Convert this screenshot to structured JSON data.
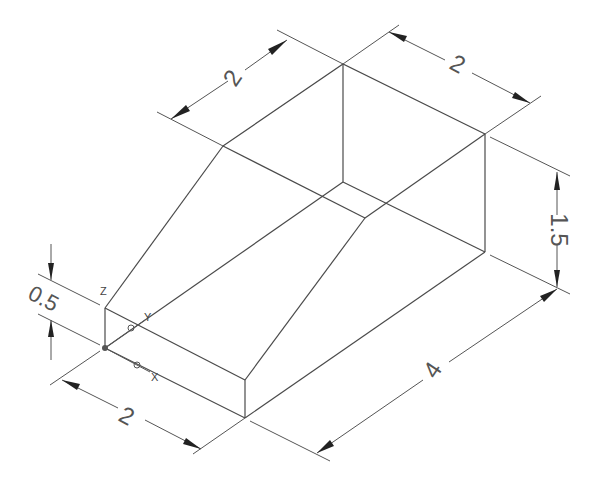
{
  "drawing": {
    "type": "isometric wedge / ramp block",
    "line_color": "#4a4a4a",
    "background": "#ffffff"
  },
  "dimensions": {
    "top_left_width": "2",
    "top_right_width": "2",
    "right_height": "1.5",
    "base_length": "4",
    "front_width": "2",
    "front_height": "0.5"
  },
  "ucs": {
    "x_label": "X",
    "y_label": "Y",
    "z_label": "Z"
  }
}
